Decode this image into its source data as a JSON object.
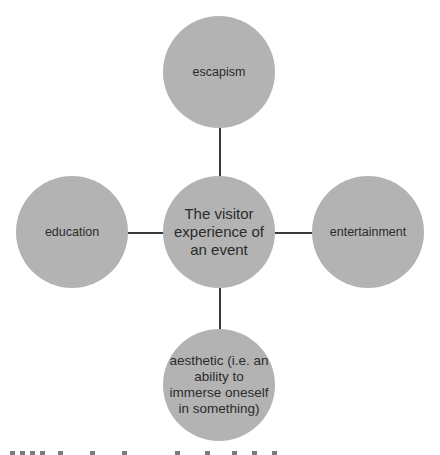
{
  "diagram": {
    "type": "hub-and-spoke",
    "center": {
      "label": "The visitor experience of an event"
    },
    "nodes": [
      {
        "position": "top",
        "label": "escapism"
      },
      {
        "position": "left",
        "label": "education"
      },
      {
        "position": "right",
        "label": "entertainment"
      },
      {
        "position": "bottom",
        "label": "aesthetic (i.e. an ability to immerse oneself in something)"
      }
    ],
    "colors": {
      "node_fill": "#b3b3b3",
      "connector": "#3a3a3a",
      "text": "#2b2b2b"
    }
  }
}
